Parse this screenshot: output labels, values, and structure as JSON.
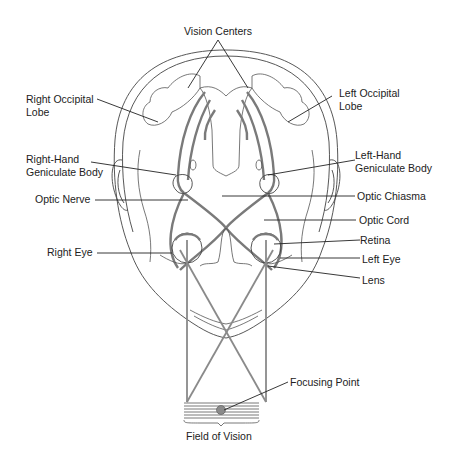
{
  "diagram": {
    "labels": {
      "vision_centers": "Vision Centers",
      "right_occipital_1": "Right Occipital",
      "right_occipital_2": "Lobe",
      "left_occipital_1": "Left Occipital",
      "left_occipital_2": "Lobe",
      "right_geniculate_1": "Right-Hand",
      "right_geniculate_2": "Geniculate Body",
      "left_geniculate_1": "Left-Hand",
      "left_geniculate_2": "Geniculate Body",
      "optic_nerve": "Optic Nerve",
      "optic_chiasma": "Optic Chiasma",
      "optic_cord": "Optic Cord",
      "right_eye": "Right Eye",
      "retina": "Retina",
      "left_eye": "Left Eye",
      "lens": "Lens",
      "focusing_point": "Focusing Point",
      "field_of_vision": "Field of Vision"
    },
    "colors": {
      "ink": "#222222",
      "tract": "#7a7a7a",
      "focus_dot": "#8a8a8a"
    }
  }
}
